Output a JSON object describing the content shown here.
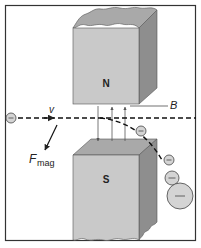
{
  "diagram": {
    "labels": {
      "north_pole": "N",
      "south_pole": "S",
      "field": "B",
      "velocity": "v",
      "force_main": "F",
      "force_sub": "mag",
      "electron_sign": "−"
    },
    "colors": {
      "frame": "#333333",
      "magnet_front": "#c8c8c8",
      "magnet_top": "#a8a8a8",
      "magnet_side": "#8a8a8a",
      "electron_fill": "#d4d4d4",
      "line": "#222222"
    },
    "electrons": [
      {
        "cx": 11,
        "cy": 118,
        "r": 5
      },
      {
        "cx": 141,
        "cy": 131,
        "r": 5
      },
      {
        "cx": 169,
        "cy": 160,
        "r": 5
      },
      {
        "cx": 172,
        "cy": 178,
        "r": 7
      },
      {
        "cx": 180,
        "cy": 196,
        "r": 13
      }
    ]
  }
}
